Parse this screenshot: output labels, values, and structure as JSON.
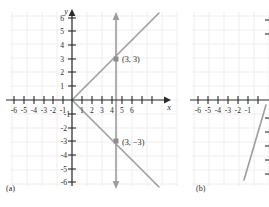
{
  "figure": {
    "type": "two-panel-coordinate-graph",
    "panels": [
      {
        "id": "a",
        "caption": "(a)",
        "axis_labels": {
          "x": "x",
          "y": "y"
        },
        "x_ticks": [
          -6,
          -5,
          -4,
          -3,
          -2,
          -1,
          1,
          2,
          3,
          4,
          5,
          6
        ],
        "y_ticks": [
          6,
          5,
          4,
          3,
          2,
          1,
          -1,
          -2,
          -3,
          -4,
          -5,
          -6
        ],
        "x_tick_labels": [
          "-6",
          "-5",
          "-4",
          "-3",
          "-2",
          "-1",
          "1",
          "2",
          "3",
          "4",
          "5",
          "6"
        ],
        "y_tick_labels": [
          "6",
          "5",
          "4",
          "3",
          "2",
          "1",
          "-1",
          "-2",
          "-3",
          "-4",
          "-5",
          "-6"
        ],
        "points": [
          {
            "label": "(3, 3)",
            "x": 3,
            "y": 3
          },
          {
            "label": "(3, −3)",
            "x": 3,
            "y": -3
          }
        ],
        "lines": [
          {
            "name": "line-y-equals-x",
            "slope": 1,
            "intercept": 0
          },
          {
            "name": "line-y-equals-negative-x",
            "slope": -1,
            "intercept": 0
          },
          {
            "name": "vertical-line-x-equals-3",
            "x": 3
          }
        ]
      },
      {
        "id": "b",
        "caption": "(b)",
        "x_ticks": [
          -6,
          -5,
          -4,
          -3,
          -2,
          -1
        ],
        "x_tick_labels": [
          "-6",
          "-5",
          "-4",
          "-3",
          "-2",
          "-1"
        ],
        "lines": [
          {
            "name": "steep-rising-line"
          }
        ]
      }
    ],
    "colors": {
      "axis": "#2b2b2b",
      "grid": "#f0ecee",
      "plot_line": "#9a9a9a",
      "point": "#8f8f8f",
      "text": "#2b2b2b",
      "background": "#ffffff"
    }
  }
}
